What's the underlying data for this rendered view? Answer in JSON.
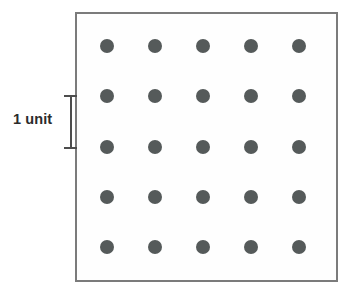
{
  "diagram": {
    "background_color": "#ffffff",
    "box": {
      "stroke_color": "#7b7b7b",
      "fill_color": "#fefefe",
      "stroke_width_px": 2,
      "left_px": 75,
      "top_px": 12,
      "width_px": 263,
      "height_px": 270
    },
    "dot_grid": {
      "rows": 5,
      "columns": 5,
      "total_dots": 25,
      "dot_color": "#555a5a",
      "dot_radius_px": 7,
      "column_centers_px": [
        107,
        155,
        203,
        251,
        299
      ],
      "row_centers_px": [
        46,
        96,
        147,
        197,
        247
      ],
      "column_spacing_px": 48,
      "row_spacing_px": 50
    },
    "scale": {
      "label": "1 unit",
      "label_color": "#2b2b2b",
      "bracket_color": "#4d4d4d",
      "bracket_top_px": 96,
      "bracket_bottom_px": 148,
      "bracket_x_px": 70,
      "measures": "vertical spacing between adjacent dot rows"
    }
  }
}
